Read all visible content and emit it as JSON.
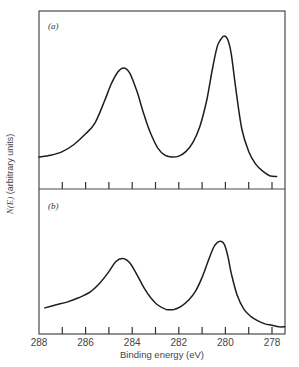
{
  "chart_data": {
    "type": "line",
    "title": "",
    "xlabel": "Binding energy (eV)",
    "ylabel": "N(E) (arbitrary units)",
    "ylabel_italic_part": "N(E)",
    "ylabel_rest": " (arbitrary units)",
    "xlim": [
      288,
      277.45
    ],
    "x_reversed": true,
    "x_tick_labels": [
      "288",
      "286",
      "284",
      "282",
      "280",
      "278"
    ],
    "x_minor_ticks": [
      287,
      286,
      285,
      284,
      283,
      282,
      281,
      280,
      279,
      278
    ],
    "grid": false,
    "legend": null,
    "panels": [
      {
        "label": "(a)",
        "ylim": [
          0,
          1
        ],
        "series": [
          {
            "name": "spectrum (a)",
            "x": [
              288.0,
              287.5,
              287.0,
              286.5,
              286.0,
              285.6,
              285.2,
              284.9,
              284.6,
              284.35,
              284.1,
              283.8,
              283.5,
              283.2,
              282.9,
              282.6,
              282.3,
              282.0,
              281.7,
              281.4,
              281.1,
              280.8,
              280.55,
              280.35,
              280.2,
              280.06,
              279.9,
              279.75,
              279.55,
              279.3,
              279.0,
              278.7,
              278.4,
              278.1,
              277.8
            ],
            "y": [
              0.18,
              0.19,
              0.21,
              0.25,
              0.31,
              0.37,
              0.49,
              0.59,
              0.66,
              0.68,
              0.65,
              0.55,
              0.42,
              0.31,
              0.23,
              0.19,
              0.18,
              0.185,
              0.21,
              0.26,
              0.35,
              0.5,
              0.68,
              0.8,
              0.84,
              0.86,
              0.84,
              0.76,
              0.56,
              0.34,
              0.21,
              0.14,
              0.1,
              0.075,
              0.07
            ]
          }
        ]
      },
      {
        "label": "(b)",
        "ylim": [
          0,
          1
        ],
        "series": [
          {
            "name": "spectrum (b)",
            "x": [
              287.75,
              287.3,
              286.8,
              286.3,
              285.8,
              285.4,
              285.0,
              284.7,
              284.4,
              284.1,
              283.8,
              283.5,
              283.2,
              282.9,
              282.55,
              282.2,
              281.9,
              281.6,
              281.3,
              281.0,
              280.7,
              280.5,
              280.35,
              280.2,
              280.05,
              279.9,
              279.75,
              279.5,
              279.2,
              278.9,
              278.6,
              278.3,
              278.0,
              277.7,
              277.45
            ],
            "y": [
              0.18,
              0.2,
              0.22,
              0.25,
              0.29,
              0.35,
              0.43,
              0.5,
              0.52,
              0.49,
              0.41,
              0.32,
              0.25,
              0.2,
              0.17,
              0.17,
              0.19,
              0.23,
              0.29,
              0.39,
              0.52,
              0.6,
              0.63,
              0.64,
              0.62,
              0.54,
              0.42,
              0.27,
              0.17,
              0.12,
              0.09,
              0.07,
              0.06,
              0.05,
              0.05
            ]
          }
        ]
      }
    ]
  }
}
